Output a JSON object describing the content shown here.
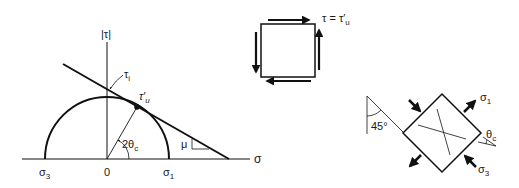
{
  "diagram": {
    "mohr_circle": {
      "axis_sigma_label": "σ",
      "axis_tau_label": "|τ|",
      "origin_label": "0",
      "sigma3_label": "σ",
      "sigma3_sub": "3",
      "sigma1_label": "σ",
      "sigma1_sub": "1",
      "tau_i_label": "τ",
      "tau_i_sub": "i",
      "tangent_point_label": "τ′",
      "tangent_point_sub": "u",
      "angle_label": "2θ",
      "angle_sub": "c",
      "slope_label": "μ"
    },
    "shear_element": {
      "label": "τ = τ′",
      "label_sub": "u"
    },
    "rotated_element": {
      "angle_label": "45°",
      "sigma1_label": "σ",
      "sigma1_sub": "1",
      "sigma3_label": "σ",
      "sigma3_sub": "3",
      "theta_label": "θ",
      "theta_sub": "c"
    }
  },
  "colors": {
    "ink": "#111111",
    "background": "#ffffff"
  }
}
